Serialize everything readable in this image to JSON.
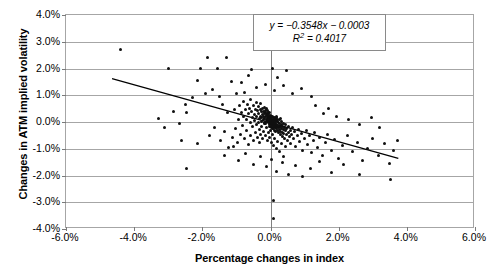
{
  "chart_data": {
    "type": "scatter",
    "title": "",
    "xlabel": "Percentage changes in index",
    "ylabel": "Changes in ATM implied volatility",
    "xlim": [
      -0.06,
      0.06
    ],
    "ylim": [
      -0.04,
      0.04
    ],
    "grid": true,
    "legend": "none",
    "x_ticks": [
      "-6.0%",
      "-4.0%",
      "-2.0%",
      "0.0%",
      "2.0%",
      "4.0%",
      "6.0%"
    ],
    "x_tick_values": [
      -0.06,
      -0.04,
      -0.02,
      0.0,
      0.02,
      0.04,
      0.06
    ],
    "y_ticks": [
      "4.0%",
      "3.0%",
      "2.0%",
      "1.0%",
      "0.0%",
      "-1.0%",
      "-2.0%",
      "-3.0%",
      "-4.0%"
    ],
    "y_tick_values": [
      0.04,
      0.03,
      0.02,
      0.01,
      0.0,
      -0.01,
      -0.02,
      -0.03,
      -0.04
    ],
    "annotation": {
      "equation": "y = −0.3548x − 0.0003",
      "r_squared_prefix": "R",
      "r_squared_exponent": "2",
      "r_squared_value": " = 0.4017"
    },
    "trendline": {
      "slope": -0.3548,
      "intercept": -0.0003,
      "x_start": -0.0465,
      "x_end": 0.0375,
      "color": "#000000"
    },
    "marker_color": "#101010",
    "points": [
      [
        -0.044,
        0.027
      ],
      [
        -0.03,
        0.02
      ],
      [
        -0.0185,
        0.024
      ],
      [
        -0.013,
        0.024
      ],
      [
        -0.0205,
        0.02
      ],
      [
        -0.0155,
        0.02
      ],
      [
        -0.0055,
        0.0195
      ],
      [
        0.0005,
        0.02
      ],
      [
        -0.023,
        0.009
      ],
      [
        -0.025,
        0.0065
      ],
      [
        -0.0245,
        0.0035
      ],
      [
        -0.0215,
        0.0155
      ],
      [
        -0.019,
        0.0105
      ],
      [
        -0.017,
        0.012
      ],
      [
        -0.015,
        0.0095
      ],
      [
        -0.014,
        0.0065
      ],
      [
        -0.0125,
        0.0035
      ],
      [
        -0.0115,
        0.015
      ],
      [
        -0.0105,
        0.0045
      ],
      [
        -0.01,
        0.0105
      ],
      [
        -0.0095,
        0.0008
      ],
      [
        -0.009,
        0.006
      ],
      [
        -0.0085,
        0.0035
      ],
      [
        -0.008,
        0.0075
      ],
      [
        -0.0078,
        0.0022
      ],
      [
        -0.0075,
        0.011
      ],
      [
        -0.0072,
        0.0045
      ],
      [
        -0.007,
        0.001
      ],
      [
        -0.0068,
        0.0065
      ],
      [
        -0.0065,
        0.003
      ],
      [
        -0.0062,
        0.005
      ],
      [
        -0.006,
        0.0
      ],
      [
        -0.0058,
        0.0085
      ],
      [
        -0.0055,
        0.004
      ],
      [
        -0.0052,
        0.0018
      ],
      [
        -0.005,
        0.0062
      ],
      [
        -0.0048,
        0.0028
      ],
      [
        -0.0046,
        0.0005
      ],
      [
        -0.0044,
        0.0048
      ],
      [
        -0.0042,
        0.0072
      ],
      [
        -0.004,
        0.002
      ],
      [
        -0.0038,
        0.0042
      ],
      [
        -0.0036,
        0.0
      ],
      [
        -0.0035,
        0.0058
      ],
      [
        -0.0034,
        0.003
      ],
      [
        -0.0032,
        0.0012
      ],
      [
        -0.003,
        0.0045
      ],
      [
        -0.0029,
        0.0068
      ],
      [
        -0.0028,
        0.0022
      ],
      [
        -0.0027,
        0.0002
      ],
      [
        -0.0026,
        0.0038
      ],
      [
        -0.0025,
        0.0015
      ],
      [
        -0.0024,
        0.0052
      ],
      [
        -0.0023,
        0.0028
      ],
      [
        -0.0022,
        0.0008
      ],
      [
        -0.0021,
        0.004
      ],
      [
        -0.002,
        0.002
      ],
      [
        -0.0019,
        0.0
      ],
      [
        -0.0018,
        0.0032
      ],
      [
        -0.0018,
        0.0055
      ],
      [
        -0.0017,
        0.0012
      ],
      [
        -0.0016,
        0.0042
      ],
      [
        -0.0015,
        0.0022
      ],
      [
        -0.0015,
        -0.0005
      ],
      [
        -0.0014,
        0.0035
      ],
      [
        -0.0013,
        0.001
      ],
      [
        -0.0012,
        0.0028
      ],
      [
        -0.0012,
        0.005
      ],
      [
        -0.0011,
        0.0002
      ],
      [
        -0.001,
        0.003
      ],
      [
        -0.001,
        0.0015
      ],
      [
        -0.0009,
        0.0042
      ],
      [
        -0.0008,
        0.0008
      ],
      [
        -0.0008,
        0.0025
      ],
      [
        -0.0007,
        -0.0002
      ],
      [
        -0.0006,
        0.0035
      ],
      [
        -0.0006,
        0.0018
      ],
      [
        -0.0005,
        0.0005
      ],
      [
        -0.0005,
        0.0028
      ],
      [
        -0.0004,
        0.0012
      ],
      [
        -0.0004,
        -0.0008
      ],
      [
        -0.0003,
        0.0022
      ],
      [
        -0.0003,
        0.0002
      ],
      [
        -0.0002,
        0.0015
      ],
      [
        -0.0002,
        0.0035
      ],
      [
        -0.0001,
        -0.0005
      ],
      [
        -0.0001,
        0.001
      ],
      [
        0.0,
        0.0025
      ],
      [
        0.0,
        0.0
      ],
      [
        0.0,
        -0.0015
      ],
      [
        0.0001,
        0.0012
      ],
      [
        0.0001,
        -0.0002
      ],
      [
        0.0002,
        0.002
      ],
      [
        0.0002,
        -0.001
      ],
      [
        0.0003,
        0.0005
      ],
      [
        0.0003,
        -0.002
      ],
      [
        0.0004,
        0.0015
      ],
      [
        0.0004,
        -0.0005
      ],
      [
        0.0005,
        0.0
      ],
      [
        0.0005,
        -0.0025
      ],
      [
        0.0006,
        0.001
      ],
      [
        0.0006,
        -0.0012
      ],
      [
        0.0007,
        -0.0002
      ],
      [
        0.0007,
        0.0022
      ],
      [
        0.0008,
        -0.0018
      ],
      [
        0.0008,
        0.0005
      ],
      [
        0.0009,
        -0.0008
      ],
      [
        0.0009,
        0.0015
      ],
      [
        0.001,
        -0.0025
      ],
      [
        0.001,
        0.0
      ],
      [
        0.0011,
        -0.0012
      ],
      [
        0.0011,
        0.001
      ],
      [
        0.0012,
        -0.003
      ],
      [
        0.0012,
        -0.0003
      ],
      [
        0.0013,
        0.0018
      ],
      [
        0.0013,
        -0.0018
      ],
      [
        0.0014,
        0.0005
      ],
      [
        0.0014,
        -0.0008
      ],
      [
        0.0015,
        -0.0022
      ],
      [
        0.0015,
        0.0012
      ],
      [
        0.0016,
        -0.0002
      ],
      [
        0.0016,
        -0.0035
      ],
      [
        0.0017,
        0.0022
      ],
      [
        0.0017,
        -0.0014
      ],
      [
        0.0018,
        0.0005
      ],
      [
        0.0018,
        -0.0025
      ],
      [
        0.0019,
        -0.0008
      ],
      [
        0.0019,
        0.0015
      ],
      [
        0.002,
        -0.0018
      ],
      [
        0.002,
        0.0002
      ],
      [
        0.0021,
        -0.0032
      ],
      [
        0.0022,
        0.001
      ],
      [
        0.0022,
        -0.0012
      ],
      [
        0.0023,
        -0.0022
      ],
      [
        0.0024,
        0.0
      ],
      [
        0.0024,
        -0.004
      ],
      [
        0.0025,
        -0.0015
      ],
      [
        0.0026,
        0.0008
      ],
      [
        0.0026,
        -0.0028
      ],
      [
        0.0027,
        -0.0005
      ],
      [
        0.0028,
        -0.0035
      ],
      [
        0.0029,
        0.0012
      ],
      [
        0.0029,
        -0.0018
      ],
      [
        0.003,
        -0.0048
      ],
      [
        0.0031,
        -0.0008
      ],
      [
        0.0032,
        -0.0025
      ],
      [
        0.0033,
        0.0002
      ],
      [
        0.0034,
        -0.0038
      ],
      [
        0.0035,
        -0.0015
      ],
      [
        0.0036,
        -0.0055
      ],
      [
        0.0037,
        -0.0028
      ],
      [
        0.0038,
        -0.0005
      ],
      [
        0.0039,
        -0.0042
      ],
      [
        0.004,
        -0.002
      ],
      [
        0.0042,
        -0.0062
      ],
      [
        0.0043,
        -0.0032
      ],
      [
        0.0044,
        -0.001
      ],
      [
        0.0046,
        -0.0048
      ],
      [
        0.0048,
        -0.0025
      ],
      [
        0.005,
        -0.007
      ],
      [
        0.0052,
        -0.0038
      ],
      [
        0.0054,
        -0.0015
      ],
      [
        0.0056,
        -0.0055
      ],
      [
        0.0058,
        -0.003
      ],
      [
        0.006,
        -0.008
      ],
      [
        0.0062,
        -0.0045
      ],
      [
        0.0065,
        -0.0022
      ],
      [
        0.0068,
        -0.0062
      ],
      [
        0.007,
        -0.0035
      ],
      [
        0.0074,
        -0.009
      ],
      [
        0.0078,
        -0.005
      ],
      [
        0.0082,
        -0.0028
      ],
      [
        0.0086,
        -0.0072
      ],
      [
        0.009,
        -0.0042
      ],
      [
        0.0095,
        -0.0105
      ],
      [
        0.01,
        -0.006
      ],
      [
        0.0105,
        -0.0032
      ],
      [
        0.011,
        -0.0085
      ],
      [
        0.0115,
        -0.005
      ],
      [
        0.012,
        -0.0115
      ],
      [
        0.0125,
        -0.007
      ],
      [
        0.013,
        -0.0038
      ],
      [
        0.0138,
        -0.0095
      ],
      [
        0.0145,
        -0.0058
      ],
      [
        0.0152,
        -0.0125
      ],
      [
        0.016,
        -0.0078
      ],
      [
        0.0168,
        -0.0045
      ],
      [
        0.0178,
        -0.0105
      ],
      [
        0.0188,
        -0.0065
      ],
      [
        0.02,
        -0.0135
      ],
      [
        0.0212,
        -0.0088
      ],
      [
        0.0225,
        -0.0052
      ],
      [
        0.024,
        -0.0112
      ],
      [
        0.0255,
        -0.0075
      ],
      [
        0.027,
        -0.0145
      ],
      [
        0.0285,
        -0.0098
      ],
      [
        0.03,
        -0.0062
      ],
      [
        0.0318,
        -0.0125
      ],
      [
        0.0335,
        -0.0082
      ],
      [
        0.035,
        -0.0155
      ],
      [
        0.036,
        -0.0108
      ],
      [
        0.0372,
        -0.0068
      ],
      [
        0.0352,
        -0.0215
      ],
      [
        -0.0215,
        -0.008
      ],
      [
        -0.018,
        -0.005
      ],
      [
        -0.0165,
        -0.002
      ],
      [
        -0.0148,
        -0.007
      ],
      [
        -0.0135,
        -0.0035
      ],
      [
        -0.0122,
        -0.0095
      ],
      [
        -0.0112,
        -0.0058
      ],
      [
        -0.0102,
        -0.0025
      ],
      [
        -0.0096,
        -0.0078
      ],
      [
        -0.0088,
        -0.0045
      ],
      [
        -0.0082,
        -0.0012
      ],
      [
        -0.0076,
        -0.0062
      ],
      [
        -0.007,
        -0.0032
      ],
      [
        -0.0064,
        -0.0085
      ],
      [
        -0.0059,
        -0.005
      ],
      [
        -0.0054,
        -0.0018
      ],
      [
        -0.0049,
        -0.0068
      ],
      [
        -0.0045,
        -0.0038
      ],
      [
        -0.0041,
        -0.0008
      ],
      [
        -0.0037,
        -0.0058
      ],
      [
        -0.0033,
        -0.0028
      ],
      [
        -0.0031,
        -0.0075
      ],
      [
        -0.0028,
        -0.0045
      ],
      [
        -0.0026,
        -0.0015
      ],
      [
        -0.0023,
        -0.0062
      ],
      [
        -0.002,
        -0.0035
      ],
      [
        -0.0017,
        -0.0005
      ],
      [
        -0.0014,
        -0.0052
      ],
      [
        -0.0011,
        -0.0022
      ],
      [
        -0.0009,
        -0.007
      ],
      [
        -0.0007,
        -0.004
      ],
      [
        -0.0004,
        -0.0018
      ],
      [
        -0.0002,
        -0.0058
      ],
      [
        0.0001,
        -0.0032
      ],
      [
        0.0003,
        -0.0078
      ],
      [
        0.0006,
        -0.0048
      ],
      [
        0.0009,
        -0.0088
      ],
      [
        0.0013,
        -0.0062
      ],
      [
        0.0017,
        -0.01
      ],
      [
        0.0021,
        -0.0072
      ],
      [
        0.0026,
        -0.0112
      ],
      [
        0.0031,
        -0.0082
      ],
      [
        0.0038,
        -0.0128
      ],
      [
        0.0045,
        -0.0092
      ],
      [
        -0.026,
        -0.007
      ],
      [
        -0.0245,
        -0.0172
      ],
      [
        -0.0135,
        -0.0125
      ],
      [
        -0.0108,
        -0.0092
      ],
      [
        -0.0095,
        -0.0145
      ],
      [
        -0.0072,
        -0.0118
      ],
      [
        -0.005,
        -0.0158
      ],
      [
        -0.003,
        -0.013
      ],
      [
        -0.0012,
        -0.0168
      ],
      [
        0.0004,
        -0.014
      ],
      [
        0.0018,
        -0.0185
      ],
      [
        0.0035,
        -0.0152
      ],
      [
        0.0054,
        -0.0195
      ],
      [
        0.0072,
        -0.0162
      ],
      [
        0.0095,
        -0.0205
      ],
      [
        0.0118,
        -0.0175
      ],
      [
        0.0145,
        -0.0148
      ],
      [
        0.0178,
        -0.0188
      ],
      [
        0.0215,
        -0.016
      ],
      [
        0.026,
        -0.0198
      ],
      [
        0.001,
        -0.036
      ],
      [
        0.0008,
        -0.0295
      ],
      [
        -0.0085,
        0.0148
      ],
      [
        -0.0042,
        0.0128
      ],
      [
        -0.0015,
        0.0142
      ],
      [
        0.0012,
        0.0118
      ],
      [
        0.0038,
        0.0135
      ],
      [
        0.0065,
        0.0108
      ],
      [
        0.009,
        0.0125
      ],
      [
        0.012,
        0.0095
      ],
      [
        -0.0065,
        0.0175
      ],
      [
        0.0022,
        0.0165
      ],
      [
        0.0048,
        0.0192
      ],
      [
        -0.033,
        0.0012
      ],
      [
        -0.031,
        -0.0022
      ],
      [
        -0.0285,
        0.004
      ],
      [
        -0.0268,
        -0.0005
      ],
      [
        0.017,
        0.005
      ],
      [
        0.0195,
        0.0022
      ],
      [
        0.0228,
        0.0008
      ],
      [
        0.0262,
        -0.0008
      ],
      [
        0.0295,
        0.0015
      ],
      [
        0.032,
        -0.002
      ],
      [
        0.0132,
        0.0062
      ],
      [
        0.0155,
        0.0032
      ]
    ]
  }
}
